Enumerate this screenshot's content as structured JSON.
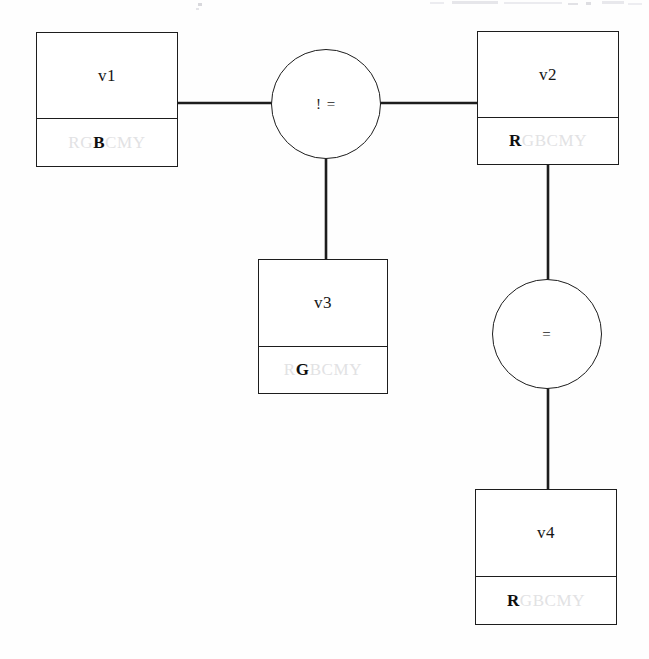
{
  "diagram": {
    "background_color": "#fefefe",
    "line_color": "#1d1d1d",
    "domain_letters": "RGBCMY",
    "domain_off_color": "#e2e2e4",
    "domain_on_color": "#0f0f0f"
  },
  "variables": [
    {
      "id": "v1",
      "label": "v1",
      "domain_prefix": "RG",
      "domain_selected": "B",
      "domain_suffix": "CMY",
      "x": 36,
      "y": 32,
      "w": 142,
      "h": 135,
      "split": 86
    },
    {
      "id": "v2",
      "label": "v2",
      "domain_prefix": "",
      "domain_selected": "R",
      "domain_suffix": "GBCMY",
      "x": 477,
      "y": 31,
      "w": 142,
      "h": 134,
      "split": 86
    },
    {
      "id": "v3",
      "label": "v3",
      "domain_prefix": "R",
      "domain_selected": "G",
      "domain_suffix": "BCMY",
      "x": 258,
      "y": 259,
      "w": 130,
      "h": 135,
      "split": 87
    },
    {
      "id": "v4",
      "label": "v4",
      "domain_prefix": "",
      "domain_selected": "R",
      "domain_suffix": "GBCMY",
      "x": 475,
      "y": 489,
      "w": 142,
      "h": 136,
      "split": 87
    }
  ],
  "constraints": [
    {
      "id": "c1",
      "label": "! =",
      "cx": 326,
      "cy": 104,
      "r": 55
    },
    {
      "id": "c2",
      "label": "=",
      "cx": 547,
      "cy": 334,
      "r": 55
    }
  ],
  "edges": [
    {
      "id": "e1",
      "from": "v1",
      "to": "c1",
      "x1": 178,
      "y1": 103,
      "x2": 272,
      "y2": 103
    },
    {
      "id": "e2",
      "from": "c1",
      "to": "v2",
      "x1": 381,
      "y1": 103,
      "x2": 477,
      "y2": 103
    },
    {
      "id": "e3",
      "from": "c1",
      "to": "v3",
      "x1": 326,
      "y1": 159,
      "x2": 326,
      "y2": 259
    },
    {
      "id": "e4",
      "from": "v2",
      "to": "c2",
      "x1": 548,
      "y1": 165,
      "x2": 548,
      "y2": 279
    },
    {
      "id": "e5",
      "from": "c2",
      "to": "v4",
      "x1": 548,
      "y1": 389,
      "x2": 548,
      "y2": 489
    }
  ]
}
